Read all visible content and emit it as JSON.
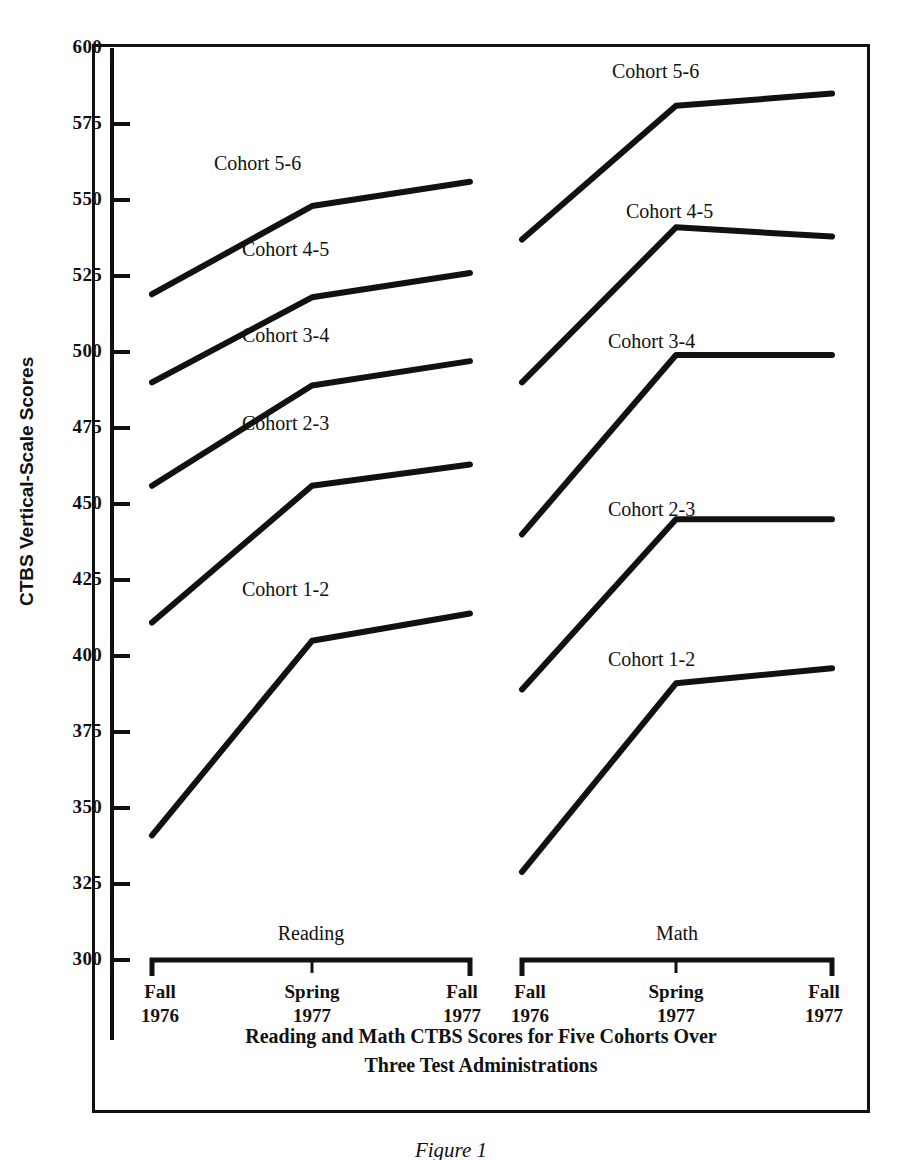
{
  "figure": {
    "number_label": "Figure 1",
    "caption_line1": "Reading and Math CTBS Scores for Five Cohorts Over",
    "caption_line2": "Three Test Administrations"
  },
  "axes": {
    "y_title": "CTBS Vertical-Scale Scores",
    "y_ticks": [
      "600",
      "575",
      "550",
      "525",
      "500",
      "475",
      "450",
      "425",
      "400",
      "375",
      "350",
      "325",
      "300"
    ]
  },
  "groups": [
    {
      "name": "reading",
      "label": "Reading",
      "x_ticks": [
        {
          "season": "Fall",
          "year": "1976"
        },
        {
          "season": "Spring",
          "year": "1977"
        },
        {
          "season": "Fall",
          "year": "1977"
        }
      ]
    },
    {
      "name": "math",
      "label": "Math",
      "x_ticks": [
        {
          "season": "Fall",
          "year": "1976"
        },
        {
          "season": "Spring",
          "year": "1977"
        },
        {
          "season": "Fall",
          "year": "1977"
        }
      ]
    }
  ],
  "series_labels": {
    "reading": [
      "Cohort 5-6",
      "Cohort 4-5",
      "Cohort 3-4",
      "Cohort 2-3",
      "Cohort 1-2"
    ],
    "math": [
      "Cohort 5-6",
      "Cohort 4-5",
      "Cohort 3-4",
      "Cohort 2-3",
      "Cohort 1-2"
    ]
  },
  "colors": {
    "line": "#111111",
    "frame": "#111111",
    "background": "#ffffff"
  },
  "chart_data": {
    "type": "line",
    "title": "Reading and Math CTBS Scores for Five Cohorts Over Three Test Administrations",
    "xlabel": "",
    "ylabel": "CTBS Vertical-Scale Scores",
    "ylim": [
      300,
      600
    ],
    "ytick_step": 25,
    "grid": false,
    "legend": "inline-labels",
    "panels": [
      {
        "name": "Reading",
        "x": [
          "Fall 1976",
          "Spring 1977",
          "Fall 1977"
        ],
        "series": [
          {
            "name": "Cohort 5-6",
            "values": [
              519,
              548,
              556
            ]
          },
          {
            "name": "Cohort 4-5",
            "values": [
              490,
              518,
              526
            ]
          },
          {
            "name": "Cohort 3-4",
            "values": [
              456,
              489,
              497
            ]
          },
          {
            "name": "Cohort 2-3",
            "values": [
              411,
              456,
              463
            ]
          },
          {
            "name": "Cohort 1-2",
            "values": [
              341,
              405,
              414
            ]
          }
        ]
      },
      {
        "name": "Math",
        "x": [
          "Fall 1976",
          "Spring 1977",
          "Fall 1977"
        ],
        "series": [
          {
            "name": "Cohort 5-6",
            "values": [
              537,
              581,
              585
            ]
          },
          {
            "name": "Cohort 4-5",
            "values": [
              490,
              541,
              538
            ]
          },
          {
            "name": "Cohort 3-4",
            "values": [
              440,
              499,
              499
            ]
          },
          {
            "name": "Cohort 2-3",
            "values": [
              389,
              445,
              445
            ]
          },
          {
            "name": "Cohort 1-2",
            "values": [
              329,
              391,
              396
            ]
          }
        ]
      }
    ]
  }
}
